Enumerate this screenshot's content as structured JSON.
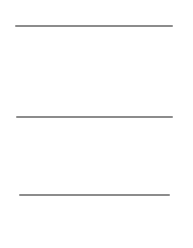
{
  "page": {
    "background": "#ffffff",
    "rule_color": "#8c8c8c"
  },
  "rules": [
    {
      "name": "rule-top",
      "x1": 15,
      "x2": 173,
      "y": 25
    },
    {
      "name": "rule-middle",
      "x1": 16,
      "x2": 173,
      "y": 116
    },
    {
      "name": "rule-bottom",
      "x1": 19,
      "x2": 170,
      "y": 194
    }
  ]
}
